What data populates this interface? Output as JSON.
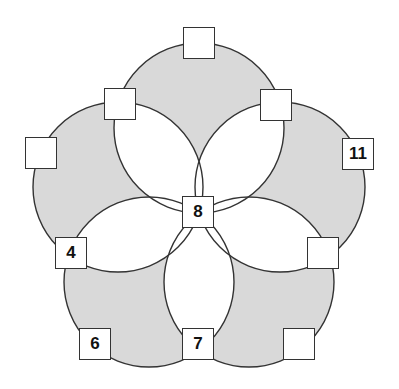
{
  "diagram": {
    "type": "five-circle-number-puzzle",
    "colors": {
      "fill": "#d9d9d9",
      "overlap": "#ffffff",
      "stroke": "#333333"
    },
    "boxes": [
      {
        "id": "top",
        "value": ""
      },
      {
        "id": "upper-left-inner",
        "value": ""
      },
      {
        "id": "upper-right-inner",
        "value": ""
      },
      {
        "id": "left-outer",
        "value": ""
      },
      {
        "id": "right-outer",
        "value": "11"
      },
      {
        "id": "center",
        "value": "8"
      },
      {
        "id": "left-inner",
        "value": "4"
      },
      {
        "id": "right-inner",
        "value": ""
      },
      {
        "id": "bottom-left-outer",
        "value": "6"
      },
      {
        "id": "bottom-inner",
        "value": "7"
      },
      {
        "id": "bottom-right-outer",
        "value": ""
      }
    ]
  }
}
